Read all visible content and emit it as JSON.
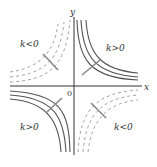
{
  "diagram": {
    "type": "function-graph",
    "function": "y = k/x",
    "axes": {
      "x_label": "x",
      "y_label": "y",
      "origin_label": "0"
    },
    "quadrant_labels": {
      "q1": "k>0",
      "q2": "k<0",
      "q3": "k>0",
      "q4": "k<0"
    },
    "curves": {
      "k_positive": {
        "style": "solid",
        "quadrants": [
          "I",
          "III"
        ],
        "count_per_quadrant": 3
      },
      "k_negative": {
        "style": "dashed",
        "quadrants": [
          "II",
          "IV"
        ],
        "count_per_quadrant": 3
      }
    },
    "colors": {
      "axis": "#333333",
      "solid_curve": "#555555",
      "dashed_curve": "#999999",
      "arrow": "#888888"
    }
  }
}
